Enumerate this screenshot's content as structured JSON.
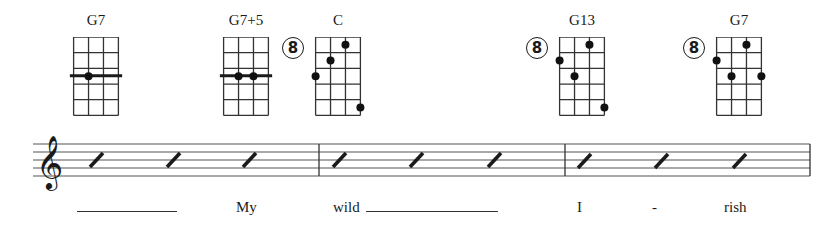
{
  "chords": [
    {
      "name": "G7",
      "left": 72,
      "fret_marker": null,
      "barre_fret_line": 2,
      "dots": [
        {
          "string": 1,
          "fret": 3
        }
      ]
    },
    {
      "name": "G7+5",
      "left": 222,
      "fret_marker": null,
      "barre_fret_line": 2,
      "dots": [
        {
          "string": 1,
          "fret": 3
        },
        {
          "string": 2,
          "fret": 3
        }
      ]
    },
    {
      "name": "C",
      "left": 314,
      "fret_marker": "8",
      "dots": [
        {
          "string": 2,
          "fret": 1
        },
        {
          "string": 1,
          "fret": 2
        },
        {
          "string": 0,
          "fret": 3
        },
        {
          "string": 3,
          "fret": 5
        }
      ]
    },
    {
      "name": "G13",
      "left": 558,
      "fret_marker": "8",
      "dots": [
        {
          "string": 2,
          "fret": 1
        },
        {
          "string": 0,
          "fret": 2
        },
        {
          "string": 1,
          "fret": 3
        },
        {
          "string": 3,
          "fret": 5
        }
      ]
    },
    {
      "name": "G7",
      "left": 715,
      "fret_marker": "8",
      "dots": [
        {
          "string": 2,
          "fret": 1
        },
        {
          "string": 0,
          "fret": 2
        },
        {
          "string": 1,
          "fret": 3
        },
        {
          "string": 3,
          "fret": 3
        }
      ]
    }
  ],
  "staff": {
    "clef": "treble",
    "measures": [
      {
        "slashes": 3
      },
      {
        "slashes": 3
      },
      {
        "slashes": 3
      }
    ]
  },
  "lyrics": [
    {
      "text": "My",
      "left": 236
    },
    {
      "text": "wild",
      "left": 333
    },
    {
      "text": "I",
      "left": 577
    },
    {
      "text": "-",
      "left": 652
    },
    {
      "text": "rish",
      "left": 724
    }
  ],
  "extenders": [
    {
      "left": 77,
      "width": 100
    },
    {
      "left": 366,
      "width": 132
    }
  ]
}
